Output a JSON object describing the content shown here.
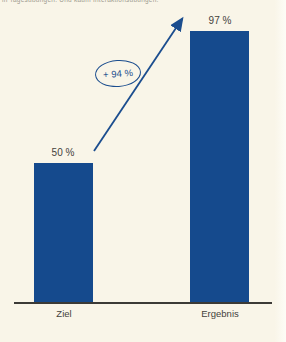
{
  "page": {
    "top_caption": "in Tagesübungen. Und kaum Interaktionsübungen."
  },
  "colors": {
    "background": "#f9f5e8",
    "bar": "#154a8d",
    "accent": "#1b4d8e",
    "text": "#44423c",
    "axis": "#3c3a36"
  },
  "chart_data": {
    "type": "bar",
    "categories": [
      "Ziel",
      "Ergebnis"
    ],
    "values": [
      50,
      97
    ],
    "value_labels": [
      "50 %",
      "97 %"
    ],
    "annotation": {
      "label": "+ 94 %",
      "shape": "ellipse",
      "arrow": "from Ziel bar top to Ergebnis bar top"
    },
    "ylim": [
      0,
      100
    ],
    "grid": false,
    "legend": false,
    "title": "",
    "xlabel": "",
    "ylabel": ""
  }
}
